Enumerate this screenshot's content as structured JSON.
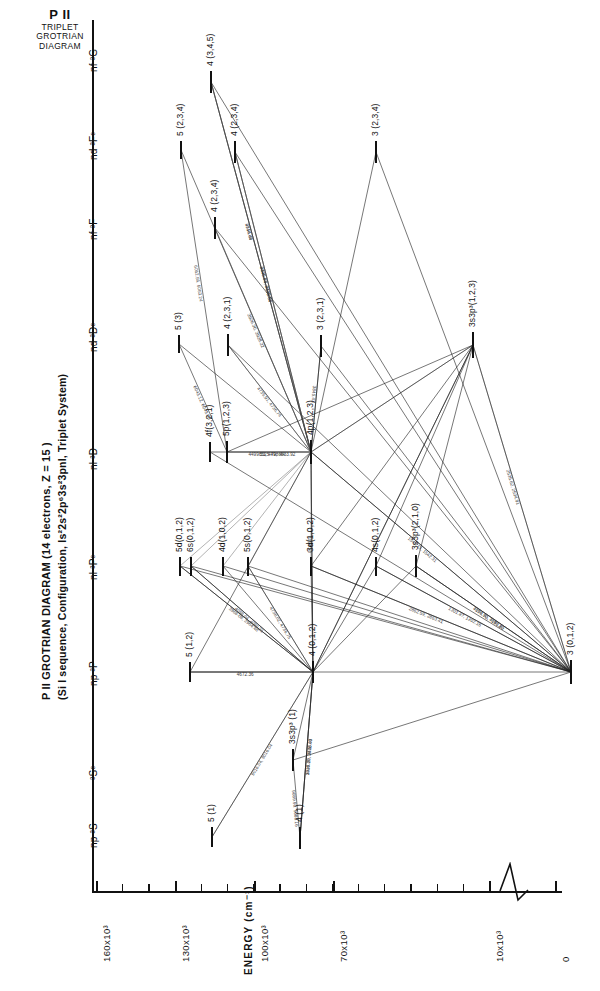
{
  "corner": {
    "line1": "P II",
    "line2": "TRIPLET",
    "line3": "GROTRIAN",
    "line4": "DIAGRAM"
  },
  "title": {
    "line1": "P II GROTRIAN DIAGRAM (14 electrons, Z = 15 )",
    "line2": "(Si I sequence, Configuration, Is²2s²2p⁶3s²3pnl, Triplet System)"
  },
  "axis": {
    "name": "ENERGY (cm⁻¹)",
    "tick_labels": [
      "160x10³",
      "130x10³",
      "100x10³",
      "70x10³",
      "10x10³",
      "0"
    ],
    "break_note": "axis-break"
  },
  "columns": [
    {
      "name": "np-3S",
      "label": "np ³S"
    },
    {
      "name": "3So",
      "label": "³Sᵒ"
    },
    {
      "name": "np-3P",
      "label": "np ³P"
    },
    {
      "name": "nl-3Po",
      "label": "nl ³Pᵒ"
    },
    {
      "name": "nl-3D",
      "label": "nl ³D"
    },
    {
      "name": "nd-3Do",
      "label": "nd ³Dᵒ"
    },
    {
      "name": "nf-3F",
      "label": "nf ³F"
    },
    {
      "name": "nd-3Fo",
      "label": "nd ³Fᵒ"
    },
    {
      "name": "nf-3G",
      "label": "nf ³G"
    }
  ],
  "levels": [
    {
      "id": "L1",
      "column": "nf-3G",
      "label": "4  (3,4,5)",
      "x": 210,
      "y": 82,
      "len": 22
    },
    {
      "id": "L2",
      "column": "nd-3Fo",
      "label": "5  (2,3,4)",
      "x": 180,
      "y": 150,
      "len": 18
    },
    {
      "id": "L3",
      "column": "nd-3Fo",
      "label": "4  (2,3,4)",
      "x": 234,
      "y": 152,
      "len": 22
    },
    {
      "id": "L4",
      "column": "nd-3Fo",
      "label": "3  (2,3,4)",
      "x": 375,
      "y": 152,
      "len": 22
    },
    {
      "id": "L5",
      "column": "nf-3F",
      "label": "4  (2,3,4)",
      "x": 214,
      "y": 228,
      "len": 22
    },
    {
      "id": "L6",
      "column": "nd-3Do",
      "label": "5 (3)",
      "x": 178,
      "y": 344,
      "len": 18
    },
    {
      "id": "L7",
      "column": "nd-3Do",
      "label": "4   (2,3,1)",
      "x": 227,
      "y": 345,
      "len": 22
    },
    {
      "id": "L8",
      "column": "nd-3Do",
      "label": "3   (2,3,1)",
      "x": 320,
      "y": 346,
      "len": 22
    },
    {
      "id": "L9",
      "column": "nd-3Do",
      "label": "3s3p³(1,2,3)",
      "x": 472,
      "y": 345,
      "len": 26
    },
    {
      "id": "L10",
      "column": "nl-3D",
      "label": "4f(3,2,1)",
      "x": 209,
      "y": 452,
      "len": 20
    },
    {
      "id": "L11",
      "column": "nl-3D",
      "label": "5p(1,2,3)",
      "x": 226,
      "y": 452,
      "len": 22
    },
    {
      "id": "L12",
      "column": "nl-3D",
      "label": "4p(1,2,3)",
      "x": 310,
      "y": 452,
      "len": 24
    },
    {
      "id": "L13",
      "column": "nl-3Po",
      "label": "5d(0,1,2)",
      "x": 179,
      "y": 566,
      "len": 19
    },
    {
      "id": "L14",
      "column": "nl-3Po",
      "label": "6s(0,1,2)",
      "x": 190,
      "y": 566,
      "len": 19
    },
    {
      "id": "L15",
      "column": "nl-3Po",
      "label": "4d(1,0,2)",
      "x": 222,
      "y": 566,
      "len": 19
    },
    {
      "id": "L16",
      "column": "nl-3Po",
      "label": "5s(0,1,2)",
      "x": 247,
      "y": 566,
      "len": 19
    },
    {
      "id": "L17",
      "column": "nl-3Po",
      "label": "3d(1,0,2)",
      "x": 310,
      "y": 566,
      "len": 19
    },
    {
      "id": "L18",
      "column": "nl-3Po",
      "label": "4s(0,1,2)",
      "x": 375,
      "y": 566,
      "len": 19
    },
    {
      "id": "L19",
      "column": "nl-3Po",
      "label": "3s3p³(2,1,0)",
      "x": 415,
      "y": 566,
      "len": 22
    },
    {
      "id": "L20",
      "column": "np-3P",
      "label": "5   (1,2)",
      "x": 189,
      "y": 672,
      "len": 20
    },
    {
      "id": "L21",
      "column": "np-3P",
      "label": "4    (0,1,2)",
      "x": 312,
      "y": 672,
      "len": 22
    },
    {
      "id": "L22",
      "column": "np-3P",
      "label": "3   (0,1,2)",
      "x": 570,
      "y": 672,
      "len": 24
    },
    {
      "id": "L23",
      "column": "3So",
      "label": "3s3p³ (1)",
      "x": 292,
      "y": 760,
      "len": 22
    },
    {
      "id": "L24",
      "column": "np-3S",
      "label": "5  (1)",
      "x": 211,
      "y": 837,
      "len": 20
    },
    {
      "id": "L25",
      "column": "np-3S",
      "label": "4  (1)",
      "x": 299,
      "y": 838,
      "len": 22
    }
  ],
  "transitions": [
    {
      "from": "L1",
      "to": "L12",
      "wl": "2710.48"
    },
    {
      "from": "L1",
      "to": "L12",
      "wl": "4944.06"
    },
    {
      "from": "L3",
      "to": "L12",
      "wl": "4490.05, 4489.86"
    },
    {
      "from": "L3",
      "to": "L12",
      "wl": "2305.84, 2335.68"
    },
    {
      "from": "L2",
      "to": "L11",
      "wl": "6062.56, 6063.24"
    },
    {
      "from": "L5",
      "to": "L12",
      "wl": "3926.30, 3928.22"
    },
    {
      "from": "L6",
      "to": "L11",
      "wl": "6043.12, 6043.08"
    },
    {
      "from": "L7",
      "to": "L12",
      "wl": "4735.91, 4736.74"
    },
    {
      "from": "L10",
      "to": "L12",
      "wl": "4499.53, 4498.44"
    },
    {
      "from": "L11",
      "to": "L12",
      "wl": "6525.79, 6533.92"
    },
    {
      "from": "L8",
      "to": "L12",
      "wl": "3845.43"
    },
    {
      "from": "L9",
      "to": "L22",
      "wl": "2535.62, 2534.91"
    },
    {
      "from": "L12",
      "to": "L21",
      "wl": "6024.18"
    },
    {
      "from": "L12",
      "to": "L22",
      "wl": "1543.13, 1542.31"
    },
    {
      "from": "L19",
      "to": "L22",
      "wl": "7070.70, 7080.20"
    },
    {
      "from": "L19",
      "to": "L22",
      "wl": "4194.90, 4191.80"
    },
    {
      "from": "L23",
      "to": "L25",
      "wl": "9089.90, 9088.16"
    },
    {
      "from": "L24",
      "to": "L21",
      "wl": "9016.04, 9016.04"
    },
    {
      "from": "L25",
      "to": "L21",
      "wl": "3446.05, 3446.40"
    },
    {
      "from": "L25",
      "to": "L21",
      "wl": "3920.20, 3928.03"
    },
    {
      "from": "L20",
      "to": "L21",
      "wl": "4672.36"
    },
    {
      "from": "L13",
      "to": "L21",
      "wl": "3966.08, 3964.48"
    },
    {
      "from": "L14",
      "to": "L21",
      "wl": "4088.04, 4080.21"
    },
    {
      "from": "L16",
      "to": "L21",
      "wl": "4738.02, 4736.75"
    },
    {
      "from": "L17",
      "to": "L22",
      "wl": "2862.59, 2863.41"
    },
    {
      "from": "L18",
      "to": "L22",
      "wl": "1301.87, 1302.16"
    }
  ]
}
